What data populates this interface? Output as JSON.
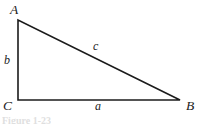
{
  "figure": {
    "type": "right-triangle-diagram",
    "background_color": "#ffffff",
    "stroke_color": "#1b1b1b",
    "label_color": "#1b1b1b",
    "caption_partial": "Figure 1-23",
    "vertices": {
      "A": {
        "label": "A",
        "x": 18,
        "y": 20
      },
      "B": {
        "label": "B",
        "x": 180,
        "y": 100
      },
      "C": {
        "label": "C",
        "x": 18,
        "y": 100
      }
    },
    "sides": {
      "a": {
        "label": "a",
        "description": "base, from C to B"
      },
      "b": {
        "label": "b",
        "description": "vertical leg, from C to A"
      },
      "c": {
        "label": "c",
        "description": "hypotenuse, from A to B"
      }
    }
  }
}
